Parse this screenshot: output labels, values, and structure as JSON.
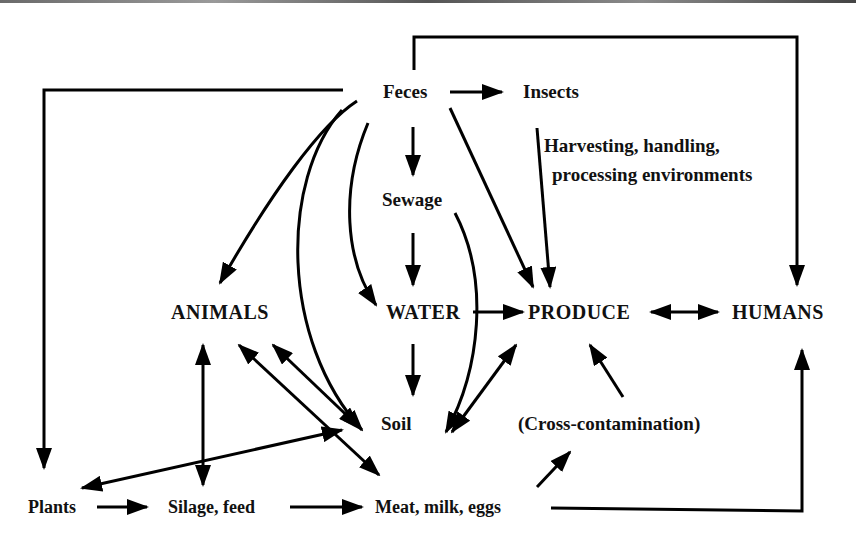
{
  "diagram": {
    "type": "flow-diagram",
    "nodes": {
      "feces": "Feces",
      "insects": "Insects",
      "harvesting": "Harvesting, handling,",
      "harvesting2": "processing environments",
      "sewage": "Sewage",
      "animals": "ANIMALS",
      "water": "WATER",
      "produce": "PRODUCE",
      "humans": "HUMANS",
      "soil": "Soil",
      "cross": "(Cross-contamination)",
      "plants": "Plants",
      "silage": "Silage, feed",
      "meat": "Meat, milk, eggs"
    },
    "edges": [
      {
        "from": "Feces",
        "to": "Insects"
      },
      {
        "from": "Feces",
        "to": "Sewage"
      },
      {
        "from": "Feces",
        "to": "HUMANS"
      },
      {
        "from": "Feces",
        "to": "Plants"
      },
      {
        "from": "Feces",
        "to": "ANIMALS"
      },
      {
        "from": "Feces",
        "to": "WATER"
      },
      {
        "from": "Feces",
        "to": "Soil"
      },
      {
        "from": "Feces",
        "to": "PRODUCE"
      },
      {
        "from": "Insects",
        "to": "PRODUCE"
      },
      {
        "from": "Sewage",
        "to": "WATER"
      },
      {
        "from": "Sewage",
        "to": "Soil"
      },
      {
        "from": "WATER",
        "to": "PRODUCE"
      },
      {
        "from": "WATER",
        "to": "Soil"
      },
      {
        "from": "PRODUCE",
        "to": "HUMANS",
        "bidirectional": true
      },
      {
        "from": "Soil",
        "to": "PRODUCE",
        "bidirectional": true
      },
      {
        "from": "ANIMALS",
        "to": "Soil",
        "bidirectional": true
      },
      {
        "from": "ANIMALS",
        "to": "Meat, milk, eggs",
        "bidirectional": true
      },
      {
        "from": "ANIMALS",
        "to": "Silage, feed",
        "bidirectional": true
      },
      {
        "from": "Soil",
        "to": "Plants",
        "bidirectional": true
      },
      {
        "from": "(Cross-contamination)",
        "to": "PRODUCE"
      },
      {
        "from": "Meat, milk, eggs",
        "to": "(Cross-contamination)"
      },
      {
        "from": "Meat, milk, eggs",
        "to": "HUMANS"
      },
      {
        "from": "Plants",
        "to": "Silage, feed"
      },
      {
        "from": "Silage, feed",
        "to": "Meat, milk, eggs"
      }
    ]
  }
}
